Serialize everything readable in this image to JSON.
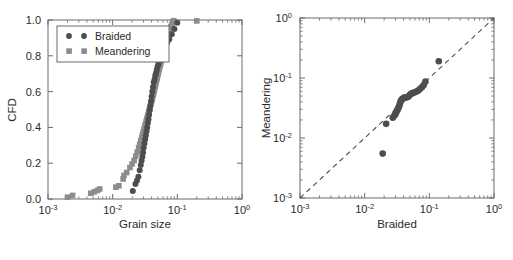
{
  "figure": {
    "background": "#ffffff",
    "panels": [
      "left-cfd-panel",
      "right-qq-panel"
    ]
  },
  "colors": {
    "braided_marker": "#4d4d4d",
    "meandering_marker": "#8c8c8c",
    "axis": "#6b6b6b",
    "text": "#2b2b2b",
    "dashed_line": "#4d4d4d"
  },
  "left_panel": {
    "name": "cumulative-frequency-distribution",
    "xlabel": "Grain size",
    "ylabel": "CFD",
    "xticks": [
      "10-3",
      "10-2",
      "10-1",
      "100"
    ],
    "xtick_mantissa": [
      "10",
      "10",
      "10",
      "10"
    ],
    "xtick_exponent": [
      "-3",
      "-2",
      "-1",
      "0"
    ],
    "yticks": [
      "0.0",
      "0.2",
      "0.4",
      "0.6",
      "0.8",
      "1.0"
    ],
    "legend": {
      "items": [
        {
          "label": "Braided",
          "marker": "circle"
        },
        {
          "label": "Meandering",
          "marker": "square"
        }
      ]
    }
  },
  "right_panel": {
    "name": "quantile-quantile-plot",
    "xlabel": "Braided",
    "ylabel": "Meandering",
    "xticks": [
      "10-3",
      "10-2",
      "10-1",
      "100"
    ],
    "xtick_exponent": [
      "-3",
      "-2",
      "-1",
      "0"
    ],
    "yticks": [
      "10-3",
      "10-2",
      "10-1",
      "100"
    ],
    "ytick_exponent": [
      "-3",
      "-2",
      "-1",
      "0"
    ],
    "reference_line": "1:1 dashed"
  },
  "chart_data": [
    {
      "type": "line",
      "name": "left-cfd-panel",
      "title": "",
      "xlabel": "Grain size",
      "ylabel": "CFD",
      "xscale": "log",
      "yscale": "linear",
      "xlim": [
        0.001,
        1.0
      ],
      "ylim": [
        0.0,
        1.0
      ],
      "grid": false,
      "legend_position": "upper-left",
      "series": [
        {
          "name": "Braided",
          "marker": "circle",
          "color": "#4d4d4d",
          "x": [
            0.0205,
            0.0225,
            0.0238,
            0.025,
            0.0262,
            0.0272,
            0.028,
            0.0288,
            0.0295,
            0.0302,
            0.031,
            0.0318,
            0.0326,
            0.0334,
            0.0342,
            0.035,
            0.0358,
            0.0366,
            0.0374,
            0.0382,
            0.0392,
            0.04,
            0.041,
            0.042,
            0.0432,
            0.0444,
            0.0456,
            0.0468,
            0.0482,
            0.0496,
            0.0512,
            0.053,
            0.055,
            0.0572,
            0.0596,
            0.0625,
            0.066,
            0.07,
            0.075,
            0.082,
            0.09,
            0.1
          ],
          "y": [
            0.044,
            0.084,
            0.104,
            0.124,
            0.16,
            0.19,
            0.214,
            0.236,
            0.26,
            0.286,
            0.31,
            0.334,
            0.356,
            0.378,
            0.4,
            0.424,
            0.446,
            0.47,
            0.496,
            0.52,
            0.546,
            0.572,
            0.6,
            0.626,
            0.652,
            0.668,
            0.69,
            0.704,
            0.722,
            0.74,
            0.756,
            0.772,
            0.788,
            0.804,
            0.82,
            0.838,
            0.856,
            0.874,
            0.892,
            0.92,
            0.95,
            0.985
          ]
        },
        {
          "name": "Meandering",
          "marker": "square",
          "color": "#8c8c8c",
          "x": [
            0.002,
            0.0024,
            0.0046,
            0.0052,
            0.0058,
            0.0063,
            0.0112,
            0.0125,
            0.0145,
            0.0165,
            0.0185,
            0.02,
            0.0215,
            0.0228,
            0.024,
            0.0252,
            0.0262,
            0.0272,
            0.0282,
            0.029,
            0.0298,
            0.0306,
            0.0314,
            0.0322,
            0.033,
            0.0338,
            0.0345,
            0.0352,
            0.036,
            0.0368,
            0.0375,
            0.0382,
            0.039,
            0.0398,
            0.0406,
            0.0414,
            0.0422,
            0.043,
            0.0438,
            0.0446,
            0.0454,
            0.0462,
            0.047,
            0.0478,
            0.0487,
            0.0496,
            0.0505,
            0.0514,
            0.0524,
            0.0534,
            0.0544,
            0.0554,
            0.0565,
            0.0576,
            0.0588,
            0.06,
            0.0612,
            0.0625,
            0.0638,
            0.0652,
            0.0666,
            0.068,
            0.0695,
            0.071,
            0.0726,
            0.0742,
            0.076,
            0.0778,
            0.0796,
            0.0816,
            0.0836,
            0.0858,
            0.088,
            0.015,
            0.2
          ],
          "y": [
            0.01,
            0.02,
            0.032,
            0.04,
            0.048,
            0.056,
            0.066,
            0.074,
            0.112,
            0.148,
            0.176,
            0.196,
            0.216,
            0.24,
            0.262,
            0.286,
            0.306,
            0.326,
            0.344,
            0.36,
            0.376,
            0.392,
            0.406,
            0.42,
            0.434,
            0.448,
            0.46,
            0.472,
            0.484,
            0.496,
            0.508,
            0.52,
            0.532,
            0.544,
            0.556,
            0.568,
            0.58,
            0.592,
            0.604,
            0.616,
            0.628,
            0.64,
            0.652,
            0.664,
            0.676,
            0.688,
            0.7,
            0.712,
            0.724,
            0.736,
            0.748,
            0.76,
            0.772,
            0.784,
            0.796,
            0.808,
            0.82,
            0.832,
            0.844,
            0.856,
            0.868,
            0.88,
            0.892,
            0.904,
            0.916,
            0.928,
            0.94,
            0.952,
            0.962,
            0.972,
            0.982,
            0.99,
            0.996,
            0.132,
            0.995
          ]
        }
      ]
    },
    {
      "type": "scatter",
      "name": "right-qq-panel",
      "title": "",
      "xlabel": "Braided",
      "ylabel": "Meandering",
      "xscale": "log",
      "yscale": "log",
      "xlim": [
        0.001,
        1.0
      ],
      "ylim": [
        0.001,
        1.0
      ],
      "grid": false,
      "reference_line": {
        "type": "1:1",
        "style": "dashed",
        "color": "#4d4d4d"
      },
      "points": {
        "x": [
          0.019,
          0.0215,
          0.0272,
          0.0285,
          0.0296,
          0.0305,
          0.0312,
          0.032,
          0.0328,
          0.0334,
          0.0342,
          0.035,
          0.0358,
          0.0366,
          0.0376,
          0.0388,
          0.04,
          0.0414,
          0.0428,
          0.0444,
          0.0462,
          0.0482,
          0.0504,
          0.0528,
          0.0554,
          0.0582,
          0.0612,
          0.0645,
          0.0682,
          0.0722,
          0.0766,
          0.0815,
          0.087,
          0.14
        ],
        "y": [
          0.0055,
          0.0172,
          0.0218,
          0.0232,
          0.0246,
          0.0262,
          0.0278,
          0.0292,
          0.0308,
          0.0322,
          0.034,
          0.037,
          0.04,
          0.042,
          0.044,
          0.0452,
          0.0462,
          0.047,
          0.0474,
          0.0478,
          0.0482,
          0.0498,
          0.053,
          0.0548,
          0.056,
          0.0572,
          0.0586,
          0.0602,
          0.0625,
          0.066,
          0.07,
          0.076,
          0.087,
          0.19
        ],
        "marker": "circle",
        "color": "#4d4d4d"
      }
    }
  ]
}
